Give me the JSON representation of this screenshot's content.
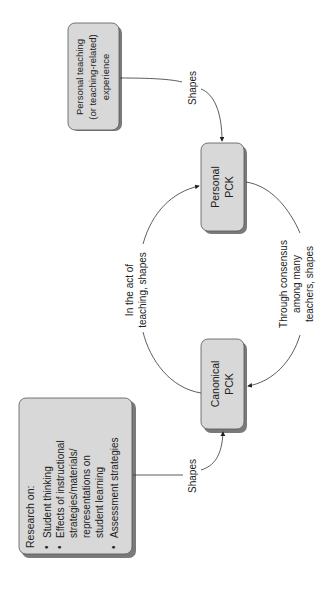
{
  "diagram": {
    "orientation": "rotated-90-ccw",
    "nodes": {
      "research": {
        "title": "Research on:",
        "bullets": [
          "Student thinking",
          "Effects of instructional",
          "strategies/materials/",
          "representations on",
          "student learning",
          "Assessment strategies"
        ],
        "bullet_flags": [
          true,
          true,
          false,
          false,
          false,
          true
        ]
      },
      "canonical": {
        "line1": "Canonical",
        "line2": "PCK"
      },
      "personal": {
        "line1": "Personal",
        "line2": "PCK"
      },
      "experience": {
        "line1": "Personal teaching",
        "line2": "(or teaching-related)",
        "line3": "experience"
      }
    },
    "edges": {
      "research_to_canonical": {
        "label": "Shapes"
      },
      "experience_to_personal": {
        "label": "Shapes"
      },
      "canonical_to_personal": {
        "line1": "In the act of",
        "line2": "teaching, shapes"
      },
      "personal_to_canonical": {
        "line1": "Through consensus",
        "line2": "among many",
        "line3": "teachers, shapes"
      }
    },
    "colors": {
      "box_fill": "#d8d8d8",
      "box_shadow": "#7a7a7a",
      "line": "#333333",
      "text": "#222222"
    }
  }
}
